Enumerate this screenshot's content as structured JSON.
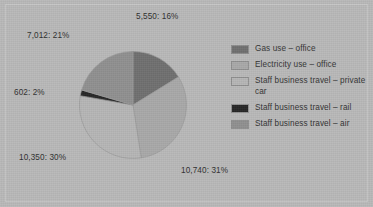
{
  "chart_data": {
    "type": "pie",
    "title": "",
    "subtitle": "",
    "xlabel": "",
    "ylabel": "",
    "legend_position": "right",
    "grid": false,
    "label_format": "value: percent",
    "categories": [
      "Gas use – office",
      "Electricity use – office",
      "Staff business travel – private car",
      "Staff business travel – rail",
      "Staff business travel – air"
    ],
    "values": [
      5550,
      10740,
      10350,
      602,
      7012
    ],
    "percents": [
      16,
      31,
      30,
      2,
      21
    ],
    "colors": [
      "#6f6f6f",
      "#a8a8a8",
      "#b5b5b5",
      "#262626",
      "#8f8f8f"
    ],
    "slice_labels": [
      "5,550: 16%",
      "10,740: 31%",
      "10,350: 30%",
      "602: 2%",
      "7,012: 21%"
    ],
    "total": 34254
  },
  "labels": {
    "gas": "5,550: 16%",
    "electricity": "10,740: 31%",
    "private_car": "10,350: 30%",
    "rail": "602: 2%",
    "air": "7,012: 21%"
  },
  "legend": {
    "items": [
      {
        "label": "Gas use – office",
        "color": "#6f6f6f"
      },
      {
        "label": "Electricity use – office",
        "color": "#a8a8a8"
      },
      {
        "label": "Staff business travel – private car",
        "color": "#b5b5b5"
      },
      {
        "label": "Staff business travel – rail",
        "color": "#262626"
      },
      {
        "label": "Staff business travel – air",
        "color": "#8f8f8f"
      }
    ]
  }
}
